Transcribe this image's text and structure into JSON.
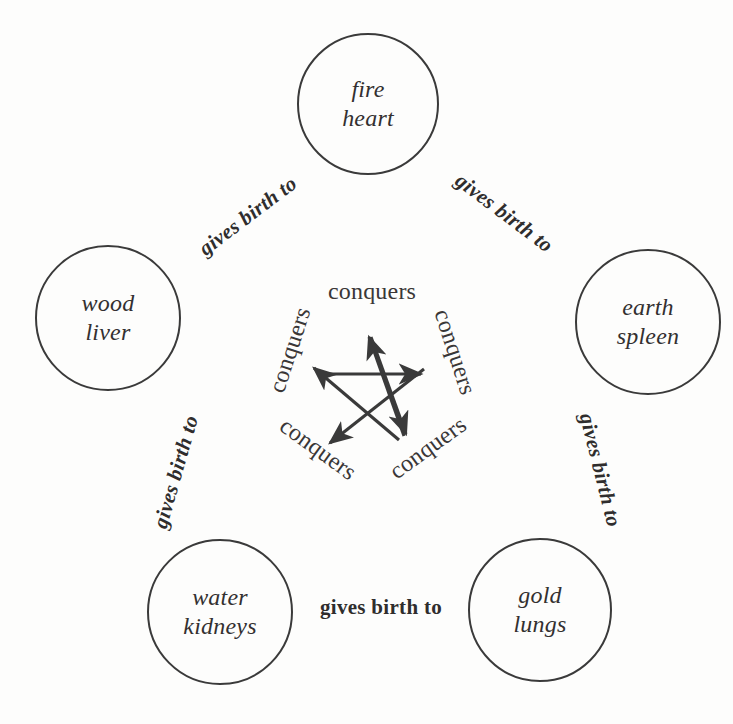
{
  "diagram": {
    "ink_color": "#3a3a3a",
    "background_color": "#fdfdfc",
    "nodes": [
      {
        "id": "fire",
        "element": "fire",
        "organ": "heart",
        "cx": 368,
        "cy": 104,
        "r": 71
      },
      {
        "id": "wood",
        "element": "wood",
        "organ": "liver",
        "cx": 108,
        "cy": 318,
        "r": 73
      },
      {
        "id": "earth",
        "element": "earth",
        "organ": "spleen",
        "cx": 648,
        "cy": 322,
        "r": 73
      },
      {
        "id": "water",
        "element": "water",
        "organ": "kidneys",
        "cx": 220,
        "cy": 612,
        "r": 73
      },
      {
        "id": "gold",
        "element": "gold",
        "organ": "lungs",
        "cx": 540,
        "cy": 610,
        "r": 72
      }
    ],
    "generating_edges": [
      {
        "id": "wood-to-fire",
        "label": "gives birth to",
        "from": "wood",
        "to": "fire",
        "x": 248,
        "y": 216,
        "rotate": -37
      },
      {
        "id": "fire-to-earth",
        "label": "gives birth to",
        "from": "fire",
        "to": "earth",
        "x": 504,
        "y": 213,
        "rotate": 37
      },
      {
        "id": "wood-to-water",
        "label": "gives birth to",
        "from": "wood",
        "to": "water",
        "x": 176,
        "y": 472,
        "rotate": -74
      },
      {
        "id": "earth-to-gold",
        "label": "gives birth to",
        "from": "earth",
        "to": "gold",
        "x": 600,
        "y": 470,
        "rotate": 76
      },
      {
        "id": "water-to-gold",
        "label": "gives birth to",
        "from": "water",
        "to": "gold",
        "x": 381,
        "y": 607,
        "rotate": 0
      }
    ],
    "conquers_edges": [
      {
        "id": "conquers-top",
        "label": "conquers",
        "x": 372,
        "y": 291,
        "rotate": 0
      },
      {
        "id": "conquers-upper-right",
        "label": "conquers",
        "x": 455,
        "y": 352,
        "rotate": 72
      },
      {
        "id": "conquers-lower-right",
        "label": "conquers",
        "x": 428,
        "y": 448,
        "rotate": 144
      },
      {
        "id": "conquers-lower-left",
        "label": "conquers",
        "x": 318,
        "y": 449,
        "rotate": -144
      },
      {
        "id": "conquers-upper-left",
        "label": "conquers",
        "x": 290,
        "y": 350,
        "rotate": -72
      }
    ],
    "pentagram": {
      "description": "five-pointed star of arrows, each arrow representing one overcoming relation",
      "center": {
        "x": 371,
        "y": 390
      },
      "radius": 52,
      "arrow_count": 5,
      "vertices": [
        {
          "id": "p-top",
          "x": 371,
          "y": 338
        },
        {
          "id": "p-right",
          "x": 420,
          "y": 374
        },
        {
          "id": "p-bottom-right",
          "x": 402,
          "y": 432
        },
        {
          "id": "p-bottom-left",
          "x": 341,
          "y": 432
        },
        {
          "id": "p-left",
          "x": 322,
          "y": 374
        }
      ],
      "arrows": [
        {
          "id": "arrow-left-to-right",
          "from": "p-left",
          "to": "p-right"
        },
        {
          "id": "arrow-bottom-right-to-top",
          "from": "p-bottom-right",
          "to": "p-top"
        },
        {
          "id": "arrow-top-to-bottom-left",
          "from": "p-top",
          "to": "p-bottom-left"
        },
        {
          "id": "arrow-right-to-bottom-left",
          "from": "p-right",
          "to": "p-bottom-left"
        },
        {
          "id": "arrow-bottom-left-to-left",
          "from": "p-bottom-left",
          "to": "p-left"
        }
      ]
    }
  }
}
